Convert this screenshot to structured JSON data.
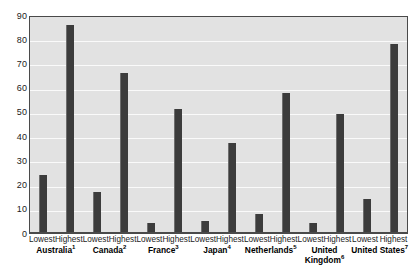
{
  "chart_data": {
    "type": "bar",
    "title": "",
    "xlabel": "",
    "ylabel": "",
    "ylim": [
      0,
      90
    ],
    "ytick_step": 10,
    "ytick_labels": [
      "90",
      "80",
      "70",
      "60",
      "50",
      "40",
      "30",
      "20",
      "10",
      "0"
    ],
    "grid": true,
    "legend": "none",
    "categories": [
      "Australia",
      "Canada",
      "France",
      "Japan",
      "Netherlands",
      "United Kingdom",
      "United States"
    ],
    "category_footnotes": [
      "1",
      "2",
      "3",
      "4",
      "5",
      "6",
      "7"
    ],
    "subcategories": [
      "Lowest",
      "Highest"
    ],
    "series": [
      {
        "name": "Lowest",
        "values": [
          24,
          17,
          4,
          5,
          8,
          4,
          14
        ]
      },
      {
        "name": "Highest",
        "values": [
          86,
          66,
          51,
          37,
          58,
          49,
          78
        ]
      }
    ]
  },
  "axis": {
    "y_ticks": [
      {
        "label": "90",
        "value": 90
      },
      {
        "label": "80",
        "value": 80
      },
      {
        "label": "70",
        "value": 70
      },
      {
        "label": "60",
        "value": 60
      },
      {
        "label": "50",
        "value": 50
      },
      {
        "label": "40",
        "value": 40
      },
      {
        "label": "30",
        "value": 30
      },
      {
        "label": "20",
        "value": 20
      },
      {
        "label": "10",
        "value": 10
      },
      {
        "label": "0",
        "value": 0
      }
    ]
  },
  "groups": [
    {
      "country": "Australia",
      "footnote": "1",
      "name_lines": [
        "Australia"
      ],
      "bars": [
        {
          "label": "Lowest",
          "value": 24
        },
        {
          "label": "Highest",
          "value": 86
        }
      ]
    },
    {
      "country": "Canada",
      "footnote": "2",
      "name_lines": [
        "Canada"
      ],
      "bars": [
        {
          "label": "Lowest",
          "value": 17
        },
        {
          "label": "Highest",
          "value": 66
        }
      ]
    },
    {
      "country": "France",
      "footnote": "3",
      "name_lines": [
        "France"
      ],
      "bars": [
        {
          "label": "Lowest",
          "value": 4
        },
        {
          "label": "Highest",
          "value": 51
        }
      ]
    },
    {
      "country": "Japan",
      "footnote": "4",
      "name_lines": [
        "Japan"
      ],
      "bars": [
        {
          "label": "Lowest",
          "value": 5
        },
        {
          "label": "Highest",
          "value": 37
        }
      ]
    },
    {
      "country": "Netherlands",
      "footnote": "5",
      "name_lines": [
        "Netherlands"
      ],
      "bars": [
        {
          "label": "Lowest",
          "value": 8
        },
        {
          "label": "Highest",
          "value": 58
        }
      ]
    },
    {
      "country": "United Kingdom",
      "footnote": "6",
      "name_lines": [
        "United",
        "Kingdom"
      ],
      "bars": [
        {
          "label": "Lowest",
          "value": 4
        },
        {
          "label": "Highest",
          "value": 49
        }
      ]
    },
    {
      "country": "United States",
      "footnote": "7",
      "name_lines": [
        "United States"
      ],
      "bars": [
        {
          "label": "Lowest",
          "value": 14
        },
        {
          "label": "Highest",
          "value": 78
        }
      ]
    }
  ],
  "colors": {
    "bar": "#3c3c3c",
    "bar_highlight": "#6e6e6e",
    "plot_background": "#e2e2e2",
    "gridline": "#fafafa",
    "axis_line": "#4a4a4a",
    "text": "#1b1b1b"
  }
}
